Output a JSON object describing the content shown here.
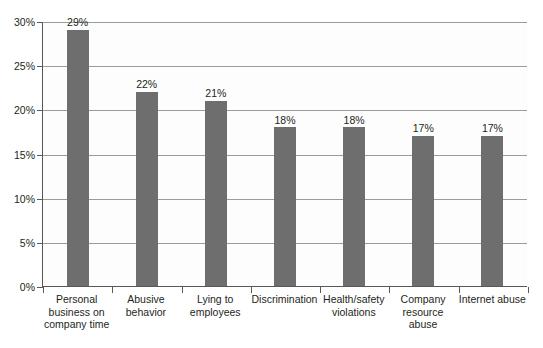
{
  "chart_data": {
    "type": "bar",
    "title": "",
    "subtitle": "",
    "xlabel": "",
    "ylabel": "",
    "categories": [
      "Personal business on company time",
      "Abusive behavior",
      "Lying to employees",
      "Discrimination",
      "Health/safety violations",
      "Company resource abuse",
      "Internet abuse"
    ],
    "values": [
      29,
      22,
      21,
      18,
      18,
      17,
      17
    ],
    "data_labels": [
      "29%",
      "22%",
      "21%",
      "18%",
      "18%",
      "17%",
      "17%"
    ],
    "ylim": [
      0,
      30
    ],
    "ytick_values": [
      0,
      5,
      10,
      15,
      20,
      25,
      30
    ],
    "ytick_labels": [
      "0%",
      "5%",
      "10%",
      "15%",
      "20%",
      "25%",
      "30%"
    ],
    "grid": "horizontal",
    "legend": "none",
    "bar_color": "#6e6e6e",
    "axis_color": "#585858",
    "gridline_color": "#9b9b9b",
    "background_color": "#ffffff",
    "text_color": "#231f20"
  }
}
